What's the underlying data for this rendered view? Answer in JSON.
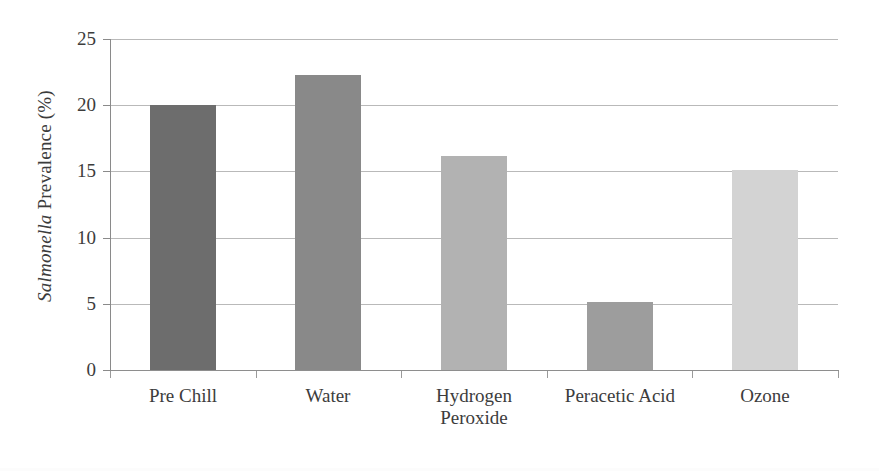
{
  "chart_data": {
    "type": "bar",
    "title": "",
    "subtitle": "",
    "xlabel": "",
    "ylabel": "Salmonella Prevalence (%)",
    "ylabel_italic_part": "Salmonella",
    "ylabel_roman_part": " Prevalence (%)",
    "categories": [
      "Pre Chill",
      "Water",
      "Hydrogen Peroxide",
      "Peracetic Acid",
      "Ozone"
    ],
    "category_lines": [
      [
        "Pre Chill"
      ],
      [
        "Water"
      ],
      [
        "Hydrogen",
        "Peroxide"
      ],
      [
        "Peracetic Acid"
      ],
      [
        "Ozone"
      ]
    ],
    "values": [
      20.0,
      22.3,
      16.2,
      5.1,
      15.1
    ],
    "ylim": [
      0,
      25
    ],
    "ytick_labels": [
      "0",
      "5",
      "10",
      "15",
      "20",
      "25"
    ],
    "ytick_values": [
      0,
      5,
      10,
      15,
      20,
      25
    ],
    "grid": true,
    "grid_axis": "y",
    "legend": "none",
    "bar_colors": [
      "#6d6d6d",
      "#898989",
      "#b2b2b2",
      "#9d9d9d",
      "#d3d3d3"
    ]
  },
  "axis_style": {
    "grid_color": "#b9b9b9",
    "axis_color": "#8a8a8a",
    "text_color": "#3c3c3c",
    "background": "#ffffff"
  }
}
